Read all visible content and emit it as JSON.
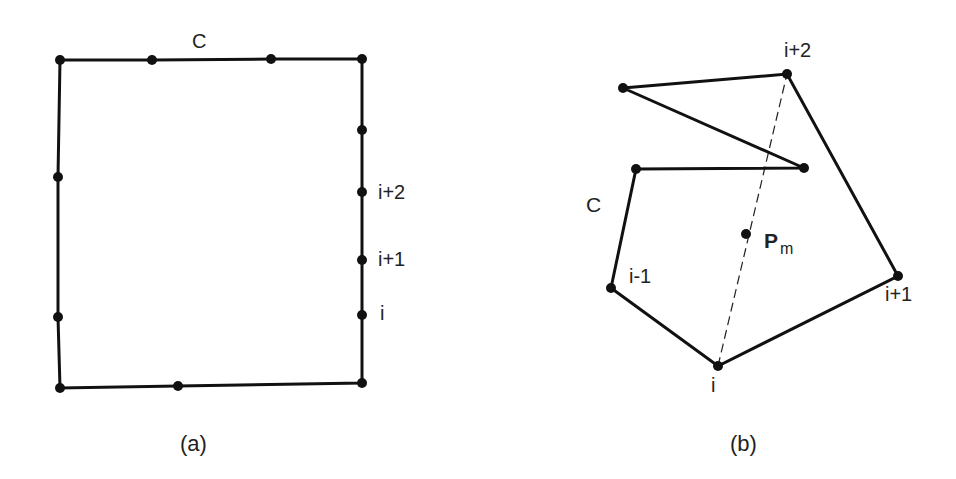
{
  "figure_a": {
    "caption": "(a)",
    "curve_label": "C",
    "vertex_labels": {
      "i": "i",
      "i_plus_1": "i+1",
      "i_plus_2": "i+2"
    },
    "polygon": [
      [
        60,
        60
      ],
      [
        152,
        60
      ],
      [
        271,
        59
      ],
      [
        362,
        59
      ],
      [
        362,
        130
      ],
      [
        362,
        192
      ],
      [
        362,
        260
      ],
      [
        362,
        315
      ],
      [
        362,
        383
      ],
      [
        178,
        386
      ],
      [
        60,
        388
      ],
      [
        58,
        317
      ],
      [
        58,
        177
      ]
    ]
  },
  "figure_b": {
    "caption": "(b)",
    "curve_label": "C",
    "point_label_main": "P",
    "point_label_sub": "m",
    "vertex_labels": {
      "i_minus_1": "i-1",
      "i": "i",
      "i_plus_1": "i+1",
      "i_plus_2": "i+2"
    },
    "polygon": [
      [
        611,
        288
      ],
      [
        718,
        366
      ],
      [
        898,
        276
      ],
      [
        787,
        74
      ],
      [
        623,
        88
      ],
      [
        804,
        168
      ],
      [
        636,
        169
      ]
    ],
    "dashed_line": [
      [
        718,
        366
      ],
      [
        787,
        74
      ]
    ],
    "point_pm": [
      746,
      234
    ]
  }
}
